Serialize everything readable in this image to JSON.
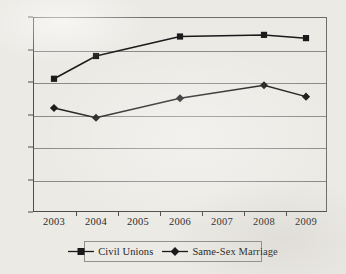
{
  "chart_data": {
    "type": "line",
    "title": "",
    "subtitle": "",
    "xlabel": "",
    "ylabel": "",
    "categories": [
      "2003",
      "2004",
      "2005",
      "2006",
      "2007",
      "2008",
      "2009"
    ],
    "ylim": [
      0,
      60
    ],
    "yticks": [
      0,
      10,
      20,
      30,
      40,
      50,
      60
    ],
    "ytick_labels": [
      "0",
      "10",
      "20",
      "30",
      "40",
      "50",
      "60"
    ],
    "grid": "horizontal",
    "legend_position": "bottom",
    "series": [
      {
        "name": "Civil Unions",
        "marker": "square",
        "color": "#1a1a1a",
        "values": [
          41,
          48,
          null,
          54,
          null,
          54.5,
          53.5
        ]
      },
      {
        "name": "Same-Sex Marriage",
        "marker": "diamond",
        "color": "#1a1a1a",
        "values": [
          32,
          29,
          null,
          35,
          null,
          39,
          35.5
        ]
      }
    ],
    "annotations": []
  },
  "legend": {
    "entries": [
      {
        "label": "Civil Unions",
        "marker": "square-marker-icon"
      },
      {
        "label": "Same-Sex Marriage",
        "marker": "diamond-marker-icon"
      }
    ]
  },
  "colors": {
    "background": "#eceae5",
    "axis": "#4d4d4d",
    "gridline": "#8a8a8a",
    "series_line": "#1a1a1a",
    "text": "#2b2b2b"
  }
}
